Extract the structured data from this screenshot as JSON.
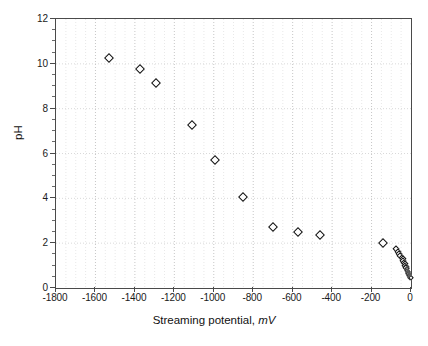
{
  "chart_data": {
    "type": "scatter",
    "title": "",
    "xlabel": "Streaming potential, mV",
    "xlabel_text": "Streaming potential,",
    "xlabel_unit": "mV",
    "ylabel": "pH",
    "xlim": [
      -1800,
      0
    ],
    "ylim": [
      0,
      12
    ],
    "xticks": [
      -1800,
      -1600,
      -1400,
      -1200,
      -1000,
      -800,
      -600,
      -400,
      -200,
      0
    ],
    "xtick_labels": [
      "-1800",
      "-1600",
      "-1400",
      "-1200",
      "-1000",
      "-800",
      "-600",
      "-400",
      "-200",
      "0"
    ],
    "yticks": [
      0,
      2,
      4,
      6,
      8,
      10,
      12
    ],
    "ytick_labels": [
      "0",
      "2",
      "4",
      "6",
      "8",
      "10",
      "12"
    ],
    "y_minor_interval": 0.5,
    "x_minor_interval": 50,
    "grid": true,
    "grid_style": "dotted-light",
    "legend": null,
    "marker": "open-diamond",
    "marker_color": "#111111",
    "marker_fill": "#ffffff",
    "series": [
      {
        "name": "pH vs streaming potential",
        "points": [
          [
            -1530,
            10.25
          ],
          [
            -1375,
            9.75
          ],
          [
            -1295,
            9.15
          ],
          [
            -1110,
            7.25
          ],
          [
            -995,
            5.7
          ],
          [
            -850,
            4.05
          ],
          [
            -700,
            2.72
          ],
          [
            -575,
            2.52
          ],
          [
            -460,
            2.35
          ],
          [
            -140,
            2.0
          ],
          [
            -78,
            1.75
          ],
          [
            -68,
            1.62
          ],
          [
            -60,
            1.52
          ],
          [
            -54,
            1.44
          ],
          [
            -48,
            1.36
          ],
          [
            -43,
            1.28
          ],
          [
            -39,
            1.2
          ],
          [
            -35,
            1.13
          ],
          [
            -32,
            1.06
          ],
          [
            -29,
            1.0
          ],
          [
            -26,
            0.94
          ],
          [
            -24,
            0.88
          ],
          [
            -21,
            0.83
          ],
          [
            -19,
            0.78
          ],
          [
            -17,
            0.73
          ],
          [
            -15,
            0.68
          ],
          [
            -13,
            0.63
          ],
          [
            -11,
            0.59
          ],
          [
            -9,
            0.55
          ],
          [
            -7,
            0.51
          ],
          [
            -5,
            0.48
          ],
          [
            -3,
            0.46
          ],
          [
            -2,
            0.45
          ]
        ]
      }
    ]
  }
}
